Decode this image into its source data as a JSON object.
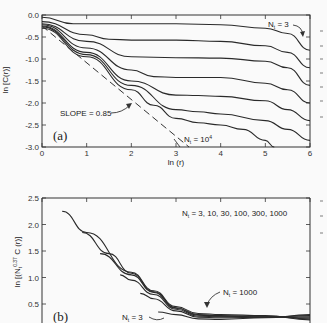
{
  "chart_data": [
    {
      "panel": "(a)",
      "type": "line",
      "title": "",
      "xlabel": "ln (r)",
      "ylabel": "ln [C(r)]",
      "xlim": [
        0,
        6
      ],
      "ylim": [
        -3.0,
        0.0
      ],
      "xticks": [
        "0",
        "1",
        "2",
        "3",
        "4",
        "5",
        "6"
      ],
      "yticks": [
        "0.0",
        "-0.5",
        "-1.0",
        "-1.5",
        "-2.0",
        "-2.5",
        "-3.0"
      ],
      "grid": false,
      "annotations": [
        "N_t = 3",
        "N_t = 10^4",
        "SLOPE = 0.85",
        "(a)"
      ],
      "series": [
        {
          "name": "N_t = 3",
          "x": [
            0,
            0.7,
            2,
            3,
            4,
            5,
            5.5,
            6
          ],
          "y": [
            -0.05,
            -0.2,
            -0.2,
            -0.2,
            -0.22,
            -0.3,
            -0.42,
            -0.8
          ]
        },
        {
          "name": "curve 2",
          "x": [
            0,
            1,
            1.5,
            2,
            3,
            4,
            5,
            5.5,
            6
          ],
          "y": [
            -0.15,
            -0.45,
            -0.55,
            -0.57,
            -0.57,
            -0.6,
            -0.7,
            -0.85,
            -1.2
          ]
        },
        {
          "name": "curve 3",
          "x": [
            0,
            1,
            2,
            3,
            4,
            5,
            5.5,
            6
          ],
          "y": [
            -0.2,
            -0.6,
            -0.95,
            -0.97,
            -0.98,
            -1.05,
            -1.2,
            -1.6
          ]
        },
        {
          "name": "curve 4",
          "x": [
            0,
            1,
            2,
            2.5,
            3,
            4,
            5,
            5.5,
            6
          ],
          "y": [
            -0.22,
            -0.75,
            -1.25,
            -1.4,
            -1.42,
            -1.42,
            -1.55,
            -1.7,
            -2.0
          ]
        },
        {
          "name": "curve 5",
          "x": [
            0,
            1,
            2,
            3,
            3.5,
            4,
            5,
            5.5,
            6
          ],
          "y": [
            -0.25,
            -0.85,
            -1.5,
            -1.82,
            -1.83,
            -1.85,
            -1.95,
            -2.15,
            -2.4
          ]
        },
        {
          "name": "curve 6",
          "x": [
            0,
            1,
            2,
            3,
            3.5,
            4,
            5,
            5.5,
            6
          ],
          "y": [
            -0.27,
            -0.9,
            -1.6,
            -2.15,
            -2.2,
            -2.25,
            -2.4,
            -2.6,
            -2.85
          ]
        },
        {
          "name": "N_t = 10^4",
          "x": [
            0,
            1,
            2,
            2.5,
            3,
            3.5,
            4,
            4.5,
            5,
            5.2
          ],
          "y": [
            -0.3,
            -0.95,
            -1.7,
            -2.05,
            -2.35,
            -2.45,
            -2.5,
            -2.6,
            -2.85,
            -3.0
          ]
        },
        {
          "name": "SLOPE = 0.85 (dashed)",
          "x": [
            0,
            3.3
          ],
          "y": [
            -0.25,
            -3.0
          ]
        }
      ]
    },
    {
      "panel": "(b)",
      "type": "line",
      "title": "",
      "xlabel": "",
      "ylabel": "ln [(N_t^0.37 C (r)]",
      "xlim": [
        0,
        6
      ],
      "ylim": [
        0.15,
        2.5
      ],
      "yticks": [
        "2.5",
        "2.0",
        "1.5",
        "1.0",
        "0.5"
      ],
      "grid": false,
      "legend_text": "N_t = 3, 10, 30, 100, 300, 1000",
      "annotations": [
        "N_t = 1000",
        "N_t = 3",
        "(b)"
      ],
      "series": [
        {
          "name": "N_t = 1000",
          "x": [
            0.45,
            1,
            2,
            2.5,
            3,
            3.5,
            4,
            5,
            6
          ],
          "y": [
            2.25,
            1.85,
            1.1,
            0.75,
            0.45,
            0.32,
            0.3,
            0.28,
            0.2
          ]
        },
        {
          "name": "N_t = 300",
          "x": [
            0.9,
            1.5,
            2,
            2.5,
            3,
            3.5,
            4,
            5,
            6
          ],
          "y": [
            1.85,
            1.45,
            1.08,
            0.73,
            0.43,
            0.3,
            0.28,
            0.27,
            0.22
          ]
        },
        {
          "name": "N_t = 100",
          "x": [
            1.3,
            2,
            2.5,
            3,
            3.5,
            4,
            5,
            6
          ],
          "y": [
            1.45,
            1.05,
            0.72,
            0.42,
            0.29,
            0.27,
            0.26,
            0.24
          ]
        },
        {
          "name": "N_t = 30",
          "x": [
            1.75,
            2,
            2.5,
            3,
            3.5,
            4,
            5,
            6
          ],
          "y": [
            1.05,
            0.95,
            0.68,
            0.4,
            0.27,
            0.26,
            0.25,
            0.26
          ]
        },
        {
          "name": "N_t = 10",
          "x": [
            2.2,
            2.5,
            3,
            3.5,
            4,
            5,
            6
          ],
          "y": [
            0.7,
            0.6,
            0.37,
            0.25,
            0.24,
            0.25,
            0.28
          ]
        },
        {
          "name": "N_t = 3",
          "x": [
            2.6,
            3,
            3.5,
            4,
            5,
            6
          ],
          "y": [
            0.35,
            0.3,
            0.22,
            0.21,
            0.24,
            0.3
          ]
        }
      ]
    }
  ],
  "panel_a": {
    "ylabel": "ln [C(r)]",
    "xlabel": "ln (r)",
    "xticks": [
      "0",
      "1",
      "2",
      "3",
      "4",
      "5",
      "6"
    ],
    "yticks": [
      "0.0",
      "-0.5",
      "-1.0",
      "-1.5",
      "-2.0",
      "-2.5",
      "-3.0"
    ],
    "label": "(a)",
    "ann_top": "N",
    "ann_top_sub": "t",
    "ann_top_val": " = 3",
    "ann_bottom": "N",
    "ann_bottom_sub": "t",
    "ann_bottom_val": " = 10",
    "ann_bottom_exp": "4",
    "slope": "SLOPE = 0.85"
  },
  "panel_b": {
    "ylabel_pre": "ln [(N",
    "ylabel_sub": "t",
    "ylabel_exp": "0.37",
    "ylabel_post": " C (r)]",
    "yticks": [
      "2.5",
      "2.0",
      "1.5",
      "1.0",
      "0.5"
    ],
    "label": "(b)",
    "legend_n": "N",
    "legend_sub": "t",
    "legend_val": " = 3, 10, 30, 100, 300, 1000",
    "ann_1000": "N",
    "ann_1000_sub": "t",
    "ann_1000_val": " = 1000",
    "ann_3": "N",
    "ann_3_sub": "t",
    "ann_3_val": " = 3"
  }
}
